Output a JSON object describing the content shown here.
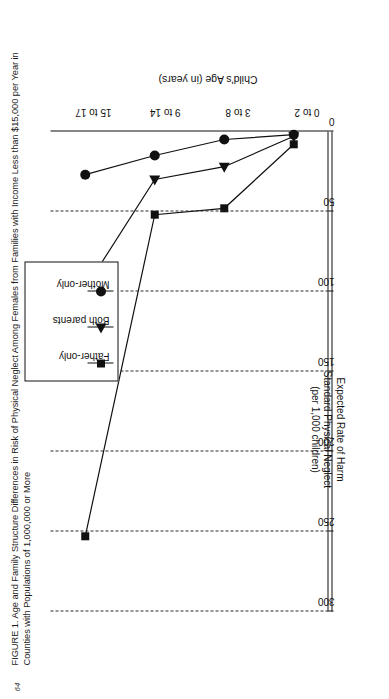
{
  "folio": "64",
  "caption": "FIGURE 1. Age and Family Structure Differences in Risk of Physical Neglect Among Females from Families with Income Less than $15,000 per Year in Counties with Populations of 1,000,000 or More",
  "axis": {
    "value_title_line1": "Expected Rate of Harm",
    "value_title_line2": "Standard Physical Neglect",
    "value_title_line3": "(per 1,000 children)",
    "category_title": "Child's Age (in years)"
  },
  "legend": {
    "items": [
      {
        "label": "Father-only",
        "marker": "square-marker"
      },
      {
        "label": "Both parents",
        "marker": "triangle-marker"
      },
      {
        "label": "Mother-only",
        "marker": "circle-marker"
      }
    ]
  },
  "chart_data": {
    "type": "line",
    "title": "FIGURE 1. Age and Family Structure Differences in Risk of Physical Neglect Among Females from Families with Income Less than $15,000 per Year in Counties with Populations of 1,000,000 or More",
    "orientation": "horizontal-rotated-90",
    "xlabel": "Child's Age (in years)",
    "ylabel": "Expected Rate of Harm Standard Physical Neglect (per 1,000 children)",
    "categories": [
      "0 to 2",
      "3 to 8",
      "9 to 14",
      "15 to 17"
    ],
    "ylim": [
      0,
      300
    ],
    "yticks": [
      0,
      50,
      100,
      150,
      200,
      250,
      300
    ],
    "grid": true,
    "legend_position": "top-right",
    "series": [
      {
        "name": "Father-only",
        "marker": "square",
        "values": [
          8,
          48,
          52,
          253
        ]
      },
      {
        "name": "Both parents",
        "marker": "triangle",
        "values": [
          3,
          22,
          30,
          98
        ]
      },
      {
        "name": "Mother-only",
        "marker": "circle",
        "values": [
          2,
          5,
          15,
          27
        ]
      }
    ]
  }
}
